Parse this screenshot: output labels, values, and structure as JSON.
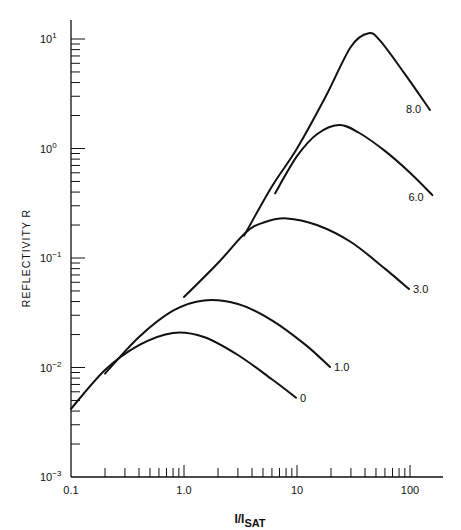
{
  "chart_data": {
    "type": "line",
    "title": "",
    "xlabel": "I/I_SAT",
    "xlabel_main": "I/I",
    "xlabel_sub": "SAT",
    "ylabel": "REFLECTIVITY R",
    "xscale": "log",
    "yscale": "log",
    "xlim": [
      0.1,
      150
    ],
    "ylim": [
      0.001,
      15
    ],
    "x_tick_labels": [
      "0.1",
      "1.0",
      "10",
      "100"
    ],
    "y_tick_labels": [
      {
        "base": "10",
        "exp": "1"
      },
      {
        "base": "10",
        "exp": "0"
      },
      {
        "base": "10",
        "exp": "−1"
      },
      {
        "base": "10",
        "exp": "−2"
      },
      {
        "base": "10",
        "exp": "−3"
      }
    ],
    "grid": false,
    "legend": "curve labels at right end of each curve",
    "series": [
      {
        "name": "0",
        "x": [
          0.1,
          0.2,
          0.4,
          0.8,
          1.5,
          3.0,
          6.0,
          9.8
        ],
        "y": [
          0.0042,
          0.0095,
          0.016,
          0.0207,
          0.019,
          0.013,
          0.0078,
          0.0053
        ]
      },
      {
        "name": "1.0",
        "x": [
          0.2,
          0.4,
          0.8,
          1.5,
          3.0,
          6.0,
          12,
          19.6
        ],
        "y": [
          0.0088,
          0.019,
          0.033,
          0.041,
          0.038,
          0.027,
          0.016,
          0.0101
        ]
      },
      {
        "name": "3.0",
        "x": [
          1.0,
          2.0,
          3.5,
          5.0,
          8.1,
          15,
          30,
          60,
          98
        ],
        "y": [
          0.044,
          0.09,
          0.17,
          0.21,
          0.23,
          0.2,
          0.14,
          0.08,
          0.052
        ]
      },
      {
        "name": "6.0",
        "x": [
          6.4,
          10,
          15,
          23.5,
          35,
          60,
          100,
          158
        ],
        "y": [
          0.39,
          0.85,
          1.35,
          1.64,
          1.4,
          0.95,
          0.6,
          0.375
        ]
      },
      {
        "name": "8.0",
        "x": [
          3.4,
          6.0,
          10,
          18,
          30,
          43,
          55,
          90,
          150
        ],
        "y": [
          0.16,
          0.45,
          1.0,
          3.0,
          8.5,
          11.3,
          9.5,
          4.8,
          2.25
        ]
      }
    ]
  },
  "axes": {
    "x_ticks": [
      {
        "label": "0.1"
      },
      {
        "label": "1.0"
      },
      {
        "label": "10"
      },
      {
        "label": "100"
      }
    ]
  },
  "curve_labels": [
    "0",
    "1.0",
    "3.0",
    "6.0",
    "8.0"
  ]
}
